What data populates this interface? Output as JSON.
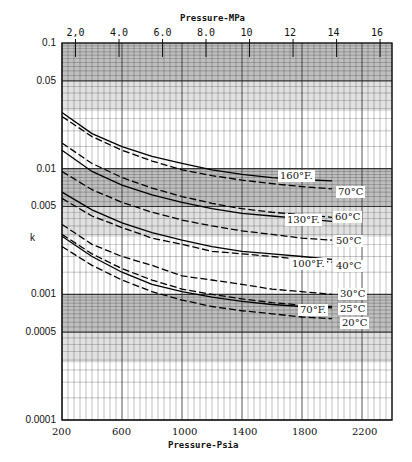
{
  "chart_data": {
    "type": "line",
    "title": "",
    "xlabel": "Pressure-Psia",
    "x2label": "Pressure-MPa",
    "ylabel": "k",
    "yscale": "log",
    "ylim": [
      0.0001,
      0.1
    ],
    "xlim": [
      200,
      2400
    ],
    "x_ticks": [
      "200",
      "600",
      "1000",
      "1400",
      "1800",
      "2200"
    ],
    "x2_ticks": [
      "2.0",
      "4.0",
      "6.0",
      "8.0",
      "10",
      "12",
      "14",
      "16"
    ],
    "y_ticks": [
      "0.1",
      "0.05",
      "0.01",
      "0.005",
      "0.001",
      "0.0005",
      "0.0001"
    ],
    "grid": true,
    "x": [
      200,
      400,
      600,
      800,
      1000,
      1200,
      1400,
      1600,
      1800,
      2000
    ],
    "series": [
      {
        "name": "160°F",
        "style": "solid",
        "values": [
          0.028,
          0.019,
          0.015,
          0.0125,
          0.011,
          0.0098,
          0.009,
          0.0085,
          0.0082,
          0.008
        ]
      },
      {
        "name": "70°C",
        "style": "dashed",
        "values": [
          0.026,
          0.018,
          0.014,
          0.0115,
          0.0098,
          0.0088,
          0.0081,
          0.0076,
          0.0072,
          0.0069
        ]
      },
      {
        "name": "60°C",
        "style": "dashed",
        "values": [
          0.016,
          0.011,
          0.0085,
          0.007,
          0.006,
          0.0053,
          0.0048,
          0.0045,
          0.0043,
          0.0041
        ]
      },
      {
        "name": "130°F",
        "style": "solid",
        "values": [
          0.014,
          0.0095,
          0.0074,
          0.0062,
          0.0054,
          0.0048,
          0.0044,
          0.0042,
          0.004,
          0.0038
        ]
      },
      {
        "name": "50°C",
        "style": "dashed",
        "values": [
          0.0095,
          0.0068,
          0.0054,
          0.0045,
          0.0039,
          0.0035,
          0.0032,
          0.003,
          0.0028,
          0.0027
        ]
      },
      {
        "name": "100°F",
        "style": "solid",
        "values": [
          0.0065,
          0.0047,
          0.0037,
          0.0031,
          0.0027,
          0.0024,
          0.0022,
          0.0021,
          0.002,
          0.0019
        ]
      },
      {
        "name": "40°C",
        "style": "dashed",
        "values": [
          0.0058,
          0.0042,
          0.0034,
          0.0028,
          0.0025,
          0.0022,
          0.0021,
          0.002,
          0.0019,
          0.0018
        ]
      },
      {
        "name": "30°C",
        "style": "dashed",
        "values": [
          0.0036,
          0.0025,
          0.002,
          0.0017,
          0.0014,
          0.0013,
          0.0012,
          0.0011,
          0.00105,
          0.001
        ]
      },
      {
        "name": "25°C",
        "style": "dashed",
        "values": [
          0.003,
          0.0021,
          0.0016,
          0.0013,
          0.0011,
          0.001,
          0.00092,
          0.00086,
          0.00082,
          0.0008
        ]
      },
      {
        "name": "70°F",
        "style": "solid",
        "values": [
          0.0029,
          0.002,
          0.0015,
          0.0012,
          0.00105,
          0.00095,
          0.00088,
          0.00083,
          0.0008,
          0.00078
        ]
      },
      {
        "name": "20°C",
        "style": "dashed",
        "values": [
          0.0024,
          0.0017,
          0.0013,
          0.00105,
          0.0009,
          0.0008,
          0.00074,
          0.0007,
          0.00066,
          0.00064
        ]
      }
    ]
  },
  "axes": {
    "x2_title": "Pressure-MPa",
    "x_title": "Pressure-Psia",
    "y_title": "k",
    "x2_ticks": [
      "2.0",
      "4.0",
      "6.0",
      "8.0",
      "10",
      "12",
      "14",
      "16"
    ],
    "x_ticks": [
      "200",
      "600",
      "1000",
      "1400",
      "1800",
      "2200"
    ],
    "y_ticks": [
      "0.1",
      "0.05",
      "0.01",
      "0.005",
      "0.001",
      "0.0005",
      "0.0001"
    ]
  },
  "labels": {
    "f160": "160°F.",
    "f130": "130°F.",
    "f100": "100°F.",
    "f70": "70°F.",
    "c70": "70°C",
    "c60": "60°C",
    "c50": "50°C",
    "c40": "40°C",
    "c30": "30°C",
    "c25": "25°C",
    "c20": "20°C"
  }
}
